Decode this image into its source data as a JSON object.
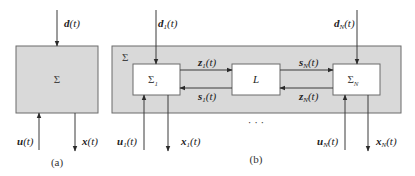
{
  "diagram": {
    "panel_a": {
      "caption": "(a)",
      "system": {
        "label": "Σ"
      },
      "inputs": {
        "disturbance": "d(t)",
        "control": "u(t)"
      },
      "outputs": {
        "state": "x(t)"
      }
    },
    "panel_b": {
      "caption": "(b)",
      "system_label": "Σ",
      "subsystem_1": {
        "label": "Σ",
        "subscript": "1"
      },
      "interconnection": {
        "label": "L"
      },
      "subsystem_N": {
        "label": "Σ",
        "subscript": "N"
      },
      "ellipsis": "· · ·",
      "signals": {
        "d1": {
          "base": "d",
          "sub": "1",
          "arg": "(t)"
        },
        "u1": {
          "base": "u",
          "sub": "1",
          "arg": "(t)"
        },
        "x1": {
          "base": "x",
          "sub": "1",
          "arg": "(t)"
        },
        "z1": {
          "base": "z",
          "sub": "1",
          "arg": "(t)"
        },
        "s1": {
          "base": "s",
          "sub": "1",
          "arg": "(t)"
        },
        "sN": {
          "base": "s",
          "sub": "N",
          "arg": "(t)"
        },
        "zN": {
          "base": "z",
          "sub": "N",
          "arg": "(t)"
        },
        "dN": {
          "base": "d",
          "sub": "N",
          "arg": "(t)"
        },
        "uN": {
          "base": "u",
          "sub": "N",
          "arg": "(t)"
        },
        "xN": {
          "base": "x",
          "sub": "N",
          "arg": "(t)"
        }
      }
    }
  }
}
